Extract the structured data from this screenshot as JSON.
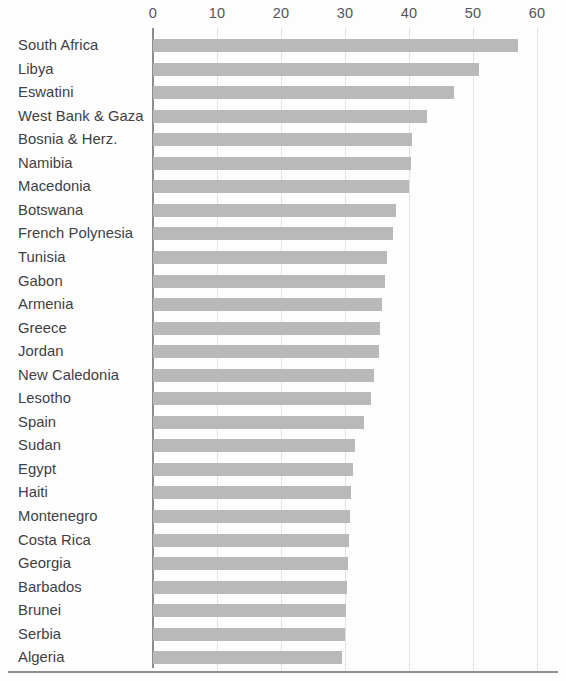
{
  "chart_data": {
    "type": "bar",
    "orientation": "horizontal",
    "title": "",
    "subtitle": "",
    "xlabel": "",
    "ylabel": "",
    "xlim": [
      0,
      60
    ],
    "ylim": null,
    "grid": true,
    "legend": null,
    "legend_position": "none",
    "xticks": [
      0,
      10,
      20,
      30,
      40,
      50,
      60
    ],
    "xtick_labels": [
      "0",
      "10",
      "20",
      "30",
      "40",
      "50",
      "60"
    ],
    "bar_color": "#b9b9b9",
    "gridline_color": "#e2e2e2",
    "axis_color": "#8d8d8d",
    "categories": [
      "South Africa",
      "Libya",
      "Eswatini",
      "West Bank & Gaza",
      "Bosnia & Herz.",
      "Namibia",
      "Macedonia",
      "Botswana",
      "French Polynesia",
      "Tunisia",
      "Gabon",
      "Armenia",
      "Greece",
      "Jordan",
      "New Caledonia",
      "Lesotho",
      "Spain",
      "Sudan",
      "Egypt",
      "Haiti",
      "Montenegro",
      "Costa Rica",
      "Georgia",
      "Barbados",
      "Brunei",
      "Serbia",
      "Algeria"
    ],
    "values": [
      57.0,
      51.0,
      47.0,
      42.8,
      40.5,
      40.3,
      40.0,
      38.0,
      37.5,
      36.5,
      36.2,
      35.8,
      35.5,
      35.3,
      34.5,
      34.0,
      33.0,
      31.5,
      31.3,
      31.0,
      30.8,
      30.6,
      30.5,
      30.3,
      30.1,
      30.0,
      29.5
    ]
  }
}
